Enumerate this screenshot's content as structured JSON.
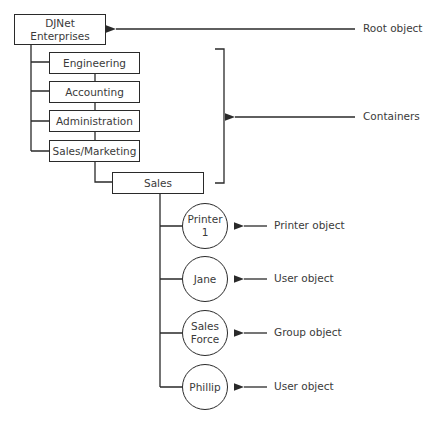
{
  "diagram": {
    "root": {
      "label": "DJNet\nEnterprises",
      "annotation": "Root object"
    },
    "containers": {
      "items": [
        {
          "label": "Engineering"
        },
        {
          "label": "Accounting"
        },
        {
          "label": "Administration"
        },
        {
          "label": "Sales/Marketing"
        }
      ],
      "child": {
        "label": "Sales"
      },
      "annotation": "Containers"
    },
    "leaf_objects": [
      {
        "label": "Printer\n1",
        "annotation": "Printer object"
      },
      {
        "label": "Jane",
        "annotation": "User object"
      },
      {
        "label": "Sales\nForce",
        "annotation": "Group object"
      },
      {
        "label": "Phillip",
        "annotation": "User object"
      }
    ],
    "colors": {
      "line": "#2a2a2a",
      "text": "#3a3a3a",
      "background": "#ffffff"
    }
  }
}
